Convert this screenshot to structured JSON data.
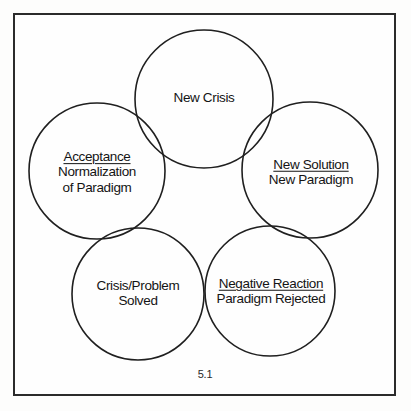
{
  "figure": {
    "caption": "5.1",
    "frame": {
      "border_color": "#2b2b2b",
      "background_color": "#fefefe"
    },
    "stroke_color": "#1f1f1f",
    "text_color": "#141414"
  },
  "nodes": [
    {
      "id": "new-crisis",
      "position": "top",
      "cx": 204,
      "cy": 99,
      "r": 69,
      "lines": [
        {
          "text": "New Crisis",
          "underlined": false
        }
      ]
    },
    {
      "id": "acceptance",
      "position": "left",
      "cx": 97,
      "cy": 171,
      "r": 68,
      "lines": [
        {
          "text": "Acceptance",
          "underlined": true
        },
        {
          "text": "Normalization",
          "underlined": false
        },
        {
          "text": "of Paradigm",
          "underlined": false
        }
      ]
    },
    {
      "id": "new-solution",
      "position": "right",
      "cx": 310,
      "cy": 170,
      "r": 68,
      "lines": [
        {
          "text": "New Solution",
          "underlined": true
        },
        {
          "text": "New Paradigm",
          "underlined": false
        }
      ]
    },
    {
      "id": "crisis-problem-solved",
      "position": "bottom-left",
      "cx": 138,
      "cy": 294,
      "r": 66,
      "lines": [
        {
          "text": "Crisis/Problem",
          "underlined": false
        },
        {
          "text": "Solved",
          "underlined": false
        }
      ]
    },
    {
      "id": "negative-reaction",
      "position": "bottom-right",
      "cx": 270,
      "cy": 291,
      "r": 65,
      "lines": [
        {
          "text": "Negative Reaction",
          "underlined": true
        },
        {
          "text": "Paradigm Rejected",
          "underlined": false
        }
      ]
    }
  ]
}
